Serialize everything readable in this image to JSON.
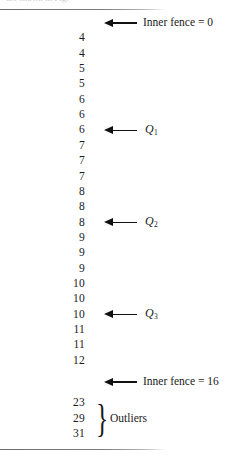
{
  "figure": {
    "title_sliver": "are shown in Fig.",
    "background_color": "#ffffff",
    "ink_color": "#1a1a1a",
    "rule_color": "#7c7c7c"
  },
  "rows": [
    {
      "value": "",
      "annotation": "Inner fence = 0",
      "kind": "fence"
    },
    {
      "value": "4",
      "annotation": "",
      "kind": "data"
    },
    {
      "value": "4",
      "annotation": "",
      "kind": "data"
    },
    {
      "value": "5",
      "annotation": "",
      "kind": "data"
    },
    {
      "value": "5",
      "annotation": "",
      "kind": "data"
    },
    {
      "value": "6",
      "annotation": "",
      "kind": "data"
    },
    {
      "value": "6",
      "annotation": "",
      "kind": "data"
    },
    {
      "value": "6",
      "annotation": "Q1",
      "kind": "quartile"
    },
    {
      "value": "7",
      "annotation": "",
      "kind": "data"
    },
    {
      "value": "7",
      "annotation": "",
      "kind": "data"
    },
    {
      "value": "7",
      "annotation": "",
      "kind": "data"
    },
    {
      "value": "8",
      "annotation": "",
      "kind": "data"
    },
    {
      "value": "8",
      "annotation": "",
      "kind": "data"
    },
    {
      "value": "8",
      "annotation": "Q2",
      "kind": "quartile"
    },
    {
      "value": "9",
      "annotation": "",
      "kind": "data"
    },
    {
      "value": "9",
      "annotation": "",
      "kind": "data"
    },
    {
      "value": "9",
      "annotation": "",
      "kind": "data"
    },
    {
      "value": "10",
      "annotation": "",
      "kind": "data"
    },
    {
      "value": "10",
      "annotation": "",
      "kind": "data"
    },
    {
      "value": "10",
      "annotation": "Q3",
      "kind": "quartile"
    },
    {
      "value": "11",
      "annotation": "",
      "kind": "data"
    },
    {
      "value": "11",
      "annotation": "",
      "kind": "data"
    },
    {
      "value": "12",
      "annotation": "",
      "kind": "data"
    },
    {
      "value": "",
      "annotation": "Inner fence = 16",
      "kind": "fence"
    },
    {
      "value": "23",
      "annotation": "",
      "kind": "outlier"
    },
    {
      "value": "29",
      "annotation": "",
      "kind": "outlier"
    },
    {
      "value": "31",
      "annotation": "",
      "kind": "outlier"
    }
  ],
  "quartile_labels": {
    "q1": {
      "letter": "Q",
      "subscript": "1"
    },
    "q2": {
      "letter": "Q",
      "subscript": "2"
    },
    "q3": {
      "letter": "Q",
      "subscript": "3"
    }
  },
  "fences": {
    "inner_lower": "Inner fence = 0",
    "inner_upper": "Inner fence = 16"
  },
  "outlier_group": {
    "brace": "}",
    "label": "Outliers",
    "values": [
      "23",
      "29",
      "31"
    ]
  }
}
